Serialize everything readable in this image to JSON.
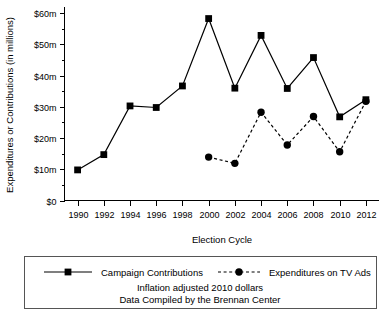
{
  "chart_data": {
    "type": "line",
    "title": "",
    "xlabel": "Election Cycle",
    "ylabel": "Expenditures or Contributions (in millions)",
    "categories": [
      1990,
      1992,
      1994,
      1996,
      1998,
      2000,
      2002,
      2004,
      2006,
      2008,
      2010,
      2012
    ],
    "x": [
      1990,
      1992,
      1994,
      1996,
      1998,
      2000,
      2002,
      2004,
      2006,
      2008,
      2010,
      2012
    ],
    "xlim": [
      1989,
      2013
    ],
    "ylim": [
      0,
      62
    ],
    "grid": false,
    "legend_position": "bottom",
    "xtick_labels": [
      "1990",
      "1992",
      "1994",
      "1996",
      "1998",
      "2000",
      "2002",
      "2004",
      "2006",
      "2008",
      "2010",
      "2012"
    ],
    "ytick_values": [
      0,
      10,
      20,
      30,
      40,
      50,
      60
    ],
    "ytick_labels": [
      "$0",
      "$10m",
      "$20m",
      "$30m",
      "$40m",
      "$50m",
      "$60m"
    ],
    "yminor_step": 5,
    "series": [
      {
        "name": "Campaign Contributions",
        "marker": "square",
        "linestyle": "solid",
        "color": "#000000",
        "x": [
          1990,
          1992,
          1994,
          1996,
          1998,
          2000,
          2002,
          2004,
          2006,
          2008,
          2010,
          2012
        ],
        "values": [
          9.8,
          14.7,
          30.3,
          29.8,
          36.7,
          58.3,
          36.0,
          52.9,
          35.9,
          45.8,
          26.8,
          32.3
        ]
      },
      {
        "name": "Expenditures on TV Ads",
        "marker": "circle",
        "linestyle": "dashed",
        "color": "#000000",
        "x": [
          2000,
          2002,
          2004,
          2006,
          2008,
          2010,
          2012
        ],
        "values": [
          13.9,
          11.9,
          28.3,
          17.8,
          26.9,
          15.6,
          31.8
        ]
      }
    ],
    "annotations": [
      "Inflation adjusted 2010 dollars",
      "Data Compiled by the Brennan Center"
    ]
  },
  "legend": {
    "items": [
      {
        "label": "Campaign Contributions",
        "marker": "square",
        "linestyle": "solid"
      },
      {
        "label": "Expenditures on TV Ads",
        "marker": "circle",
        "linestyle": "dashed"
      }
    ]
  },
  "caption": {
    "line1": "Inflation adjusted 2010 dollars",
    "line2": "Data Compiled by the Brennan Center"
  },
  "axes": {
    "y_title": "Expenditures or Contributions (in millions)",
    "x_title": "Election Cycle"
  }
}
